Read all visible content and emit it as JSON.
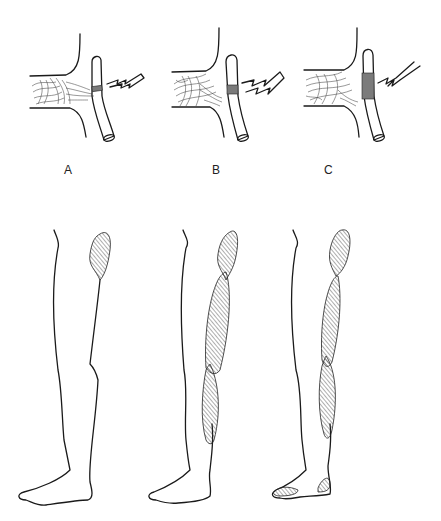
{
  "figure": {
    "panels": [
      {
        "id": "A",
        "label": "A",
        "compression": "mild",
        "leg_hatched_regions": [
          "upper-thigh-posterior"
        ]
      },
      {
        "id": "B",
        "label": "B",
        "compression": "moderate",
        "leg_hatched_regions": [
          "upper-thigh-posterior",
          "thigh-posterior",
          "calf-posterior"
        ]
      },
      {
        "id": "C",
        "label": "C",
        "compression": "severe",
        "leg_hatched_regions": [
          "upper-thigh-posterior",
          "thigh-posterior",
          "calf-posterior",
          "heel",
          "toes"
        ]
      }
    ],
    "colors": {
      "ink": "#1a1a1a",
      "background": "#ffffff"
    }
  }
}
